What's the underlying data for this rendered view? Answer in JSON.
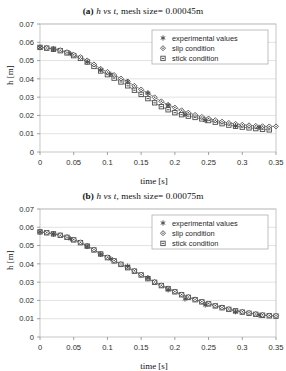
{
  "page": {
    "background": "#ffffff",
    "figure_count": 2
  },
  "charts": [
    {
      "panel_label": "(a)",
      "title_math": "h vs t,",
      "title_rest": "mesh size= 0.00045m",
      "title_full": "(a) h vs t, mesh size= 0.00045m"
    },
    {
      "panel_label": "(b)",
      "title_math": "h vs t,",
      "title_rest": "mesh size= 0.00075m",
      "title_full": "(b) h vs t, mesh size= 0.00075m"
    }
  ],
  "chart_data": [
    {
      "type": "scatter",
      "title": "(a) h vs t, mesh size= 0.00045m",
      "xlabel": "time [s]",
      "ylabel": "h [m]",
      "xlim": [
        0,
        0.35
      ],
      "ylim": [
        0,
        0.07
      ],
      "xticks": [
        "0",
        "0.05",
        "0.1",
        "0.15",
        "0.2",
        "0.25",
        "0.3",
        "0.35"
      ],
      "xtickvalues": [
        0,
        0.05,
        0.1,
        0.15,
        0.2,
        0.25,
        0.3,
        0.35
      ],
      "yticks": [
        "0",
        "0.01",
        "0.02",
        "0.03",
        "0.04",
        "0.05",
        "0.06",
        "0.07"
      ],
      "ytickvalues": [
        0,
        0.01,
        0.02,
        0.03,
        0.04,
        0.05,
        0.06,
        0.07
      ],
      "grid": "horizontal",
      "legend_position": "top-right",
      "marker_color": "#4d4d4d",
      "line_color": "#6b6b6b",
      "series": [
        {
          "name": "experimental values",
          "marker": "star",
          "x": [
            0.0,
            0.02,
            0.045,
            0.07,
            0.09,
            0.105,
            0.13,
            0.16,
            0.19,
            0.215,
            0.245,
            0.29,
            0.325
          ],
          "values": [
            0.0572,
            0.0562,
            0.0538,
            0.0492,
            0.0448,
            0.0425,
            0.0385,
            0.0322,
            0.0255,
            0.0205,
            0.0172,
            0.0142,
            0.0135
          ]
        },
        {
          "name": "slip condition",
          "marker": "diamond",
          "x": [
            0.0,
            0.01,
            0.02,
            0.03,
            0.04,
            0.05,
            0.06,
            0.07,
            0.08,
            0.09,
            0.1,
            0.11,
            0.12,
            0.13,
            0.14,
            0.15,
            0.16,
            0.17,
            0.18,
            0.19,
            0.2,
            0.21,
            0.22,
            0.23,
            0.24,
            0.25,
            0.26,
            0.27,
            0.28,
            0.29,
            0.3,
            0.31,
            0.32,
            0.33,
            0.34,
            0.35
          ],
          "values": [
            0.0572,
            0.0569,
            0.0564,
            0.0557,
            0.0546,
            0.0532,
            0.0519,
            0.0501,
            0.0479,
            0.0455,
            0.0438,
            0.0421,
            0.0402,
            0.0386,
            0.0362,
            0.0342,
            0.0322,
            0.0299,
            0.0277,
            0.0258,
            0.0243,
            0.0228,
            0.0215,
            0.0203,
            0.0192,
            0.0183,
            0.0174,
            0.0166,
            0.0159,
            0.0154,
            0.0149,
            0.0146,
            0.0143,
            0.0141,
            0.014,
            0.014
          ]
        },
        {
          "name": "stick condition",
          "marker": "square",
          "x": [
            0.0,
            0.01,
            0.02,
            0.03,
            0.04,
            0.05,
            0.06,
            0.07,
            0.08,
            0.09,
            0.1,
            0.11,
            0.12,
            0.13,
            0.14,
            0.15,
            0.16,
            0.17,
            0.18,
            0.19,
            0.2,
            0.21,
            0.22,
            0.23,
            0.24,
            0.25,
            0.26,
            0.27,
            0.28,
            0.29,
            0.3,
            0.31,
            0.32,
            0.33,
            0.34
          ],
          "values": [
            0.0572,
            0.0568,
            0.0562,
            0.0554,
            0.0542,
            0.0527,
            0.0512,
            0.0492,
            0.0468,
            0.0443,
            0.0423,
            0.0404,
            0.0383,
            0.0362,
            0.0338,
            0.0315,
            0.0292,
            0.0269,
            0.0248,
            0.0231,
            0.0215,
            0.0204,
            0.0196,
            0.0189,
            0.0181,
            0.0172,
            0.0163,
            0.0155,
            0.0147,
            0.0141,
            0.0136,
            0.0132,
            0.0128,
            0.0124,
            0.0121
          ]
        }
      ]
    },
    {
      "type": "scatter",
      "title": "(b) h vs t, mesh size= 0.00075m",
      "xlabel": "time [s]",
      "ylabel": "h [m]",
      "xlim": [
        0,
        0.35
      ],
      "ylim": [
        0,
        0.07
      ],
      "xticks": [
        "0",
        "0.05",
        "0.1",
        "0.15",
        "0.2",
        "0.25",
        "0.3",
        "0.35"
      ],
      "xtickvalues": [
        0,
        0.05,
        0.1,
        0.15,
        0.2,
        0.25,
        0.3,
        0.35
      ],
      "yticks": [
        "0",
        "0.01",
        "0.02",
        "0.03",
        "0.04",
        "0.05",
        "0.06",
        "0.07"
      ],
      "ytickvalues": [
        0,
        0.01,
        0.02,
        0.03,
        0.04,
        0.05,
        0.06,
        0.07
      ],
      "grid": "horizontal",
      "legend_position": "top-right",
      "marker_color": "#4d4d4d",
      "line_color": "#6b6b6b",
      "series": [
        {
          "name": "experimental values",
          "marker": "star",
          "x": [
            0.0,
            0.02,
            0.045,
            0.07,
            0.09,
            0.105,
            0.13,
            0.16,
            0.19,
            0.215,
            0.245,
            0.29,
            0.325
          ],
          "values": [
            0.0575,
            0.0563,
            0.0537,
            0.0495,
            0.0452,
            0.0428,
            0.0388,
            0.0325,
            0.0258,
            0.0208,
            0.0175,
            0.0138,
            0.0118
          ]
        },
        {
          "name": "slip condition",
          "marker": "diamond",
          "x": [
            0.0,
            0.01,
            0.02,
            0.03,
            0.04,
            0.05,
            0.06,
            0.07,
            0.08,
            0.09,
            0.1,
            0.11,
            0.12,
            0.13,
            0.14,
            0.15,
            0.16,
            0.17,
            0.18,
            0.19,
            0.2,
            0.21,
            0.22,
            0.23,
            0.24,
            0.25,
            0.26,
            0.27,
            0.28,
            0.29,
            0.3,
            0.31,
            0.32,
            0.33,
            0.34,
            0.35
          ],
          "values": [
            0.0575,
            0.0571,
            0.0565,
            0.0557,
            0.0546,
            0.0533,
            0.0518,
            0.0499,
            0.0478,
            0.0456,
            0.0436,
            0.0418,
            0.0399,
            0.0381,
            0.0362,
            0.0341,
            0.0321,
            0.0301,
            0.0283,
            0.0266,
            0.0249,
            0.0233,
            0.0219,
            0.0206,
            0.0194,
            0.0183,
            0.0172,
            0.0162,
            0.0153,
            0.0145,
            0.0138,
            0.0132,
            0.0126,
            0.0121,
            0.0118,
            0.0116
          ]
        },
        {
          "name": "stick condition",
          "marker": "square",
          "x": [
            0.0,
            0.01,
            0.02,
            0.03,
            0.04,
            0.05,
            0.06,
            0.07,
            0.08,
            0.09,
            0.1,
            0.11,
            0.12,
            0.13,
            0.14,
            0.15,
            0.16,
            0.17,
            0.18,
            0.19,
            0.2,
            0.21,
            0.22,
            0.23,
            0.24,
            0.25,
            0.26,
            0.27,
            0.28,
            0.29,
            0.3,
            0.31,
            0.32,
            0.33,
            0.34,
            0.35
          ],
          "values": [
            0.0575,
            0.057,
            0.0564,
            0.0556,
            0.0545,
            0.0531,
            0.0516,
            0.0497,
            0.0476,
            0.0454,
            0.0434,
            0.0416,
            0.0397,
            0.0379,
            0.036,
            0.0339,
            0.0319,
            0.0299,
            0.0281,
            0.0264,
            0.0247,
            0.0231,
            0.0217,
            0.0204,
            0.0192,
            0.0181,
            0.017,
            0.016,
            0.0151,
            0.0143,
            0.0136,
            0.013,
            0.0124,
            0.0119,
            0.0116,
            0.0114
          ]
        }
      ]
    }
  ]
}
